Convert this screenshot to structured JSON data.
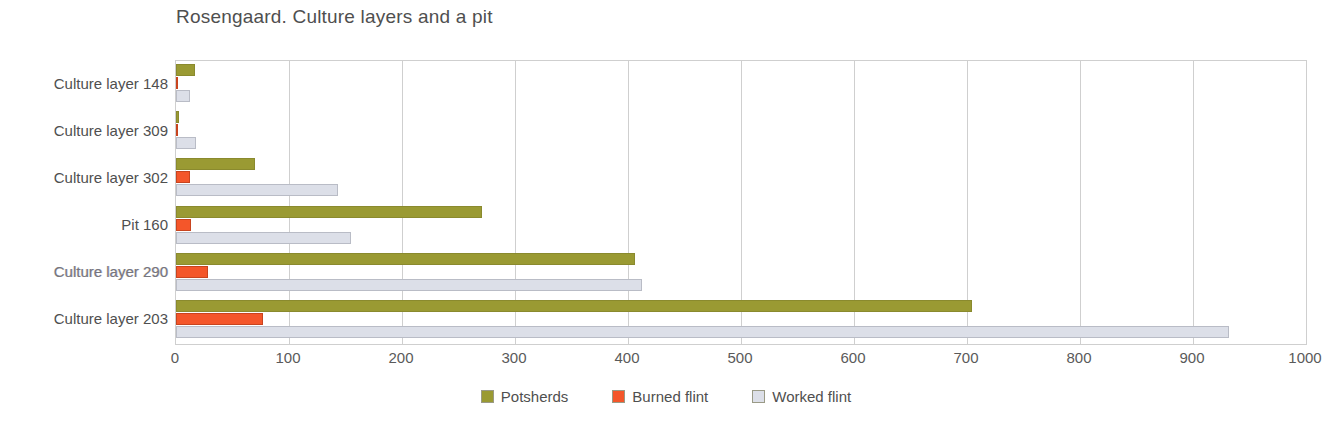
{
  "chart_data": {
    "type": "bar",
    "orientation": "horizontal",
    "title": "Rosengaard. Culture layers and a pit",
    "xlabel": "",
    "ylabel": "",
    "xlim": [
      0,
      1000
    ],
    "xticks": [
      0,
      100,
      200,
      300,
      400,
      500,
      600,
      700,
      800,
      900,
      1000
    ],
    "xtick_labels": [
      "0",
      "100",
      "200",
      "300",
      "400",
      "500",
      "600",
      "700",
      "800",
      "900",
      "1000"
    ],
    "grid": true,
    "grid_axis": "x",
    "legend_position": "bottom-center",
    "categories": [
      "Culture layer 148",
      "Culture layer 309",
      "Culture layer 302",
      "Pit 160",
      "Culture layer 290",
      "Culture layer 203"
    ],
    "series": [
      {
        "name": "Potsherds",
        "color": "#9a9a33",
        "values": [
          17,
          3,
          70,
          271,
          406,
          704
        ]
      },
      {
        "name": "Burned flint",
        "color": "#f4562a",
        "values": [
          2,
          1,
          12,
          13,
          28,
          77
        ]
      },
      {
        "name": "Worked flint",
        "color": "#dcdfe8",
        "values": [
          12,
          18,
          143,
          155,
          412,
          932
        ]
      }
    ]
  },
  "legend": {
    "items": [
      {
        "label": "Potsherds",
        "color": "#9a9a33"
      },
      {
        "label": "Burned flint",
        "color": "#f4562a"
      },
      {
        "label": "Worked flint",
        "color": "#dcdfe8"
      }
    ]
  },
  "colors": {
    "potsherds": "#9a9a33",
    "burned_flint": "#f4562a",
    "worked_flint": "#dcdfe8",
    "grid": "#cfcfcf",
    "text": "#4f4f4f",
    "background": "#ffffff"
  }
}
